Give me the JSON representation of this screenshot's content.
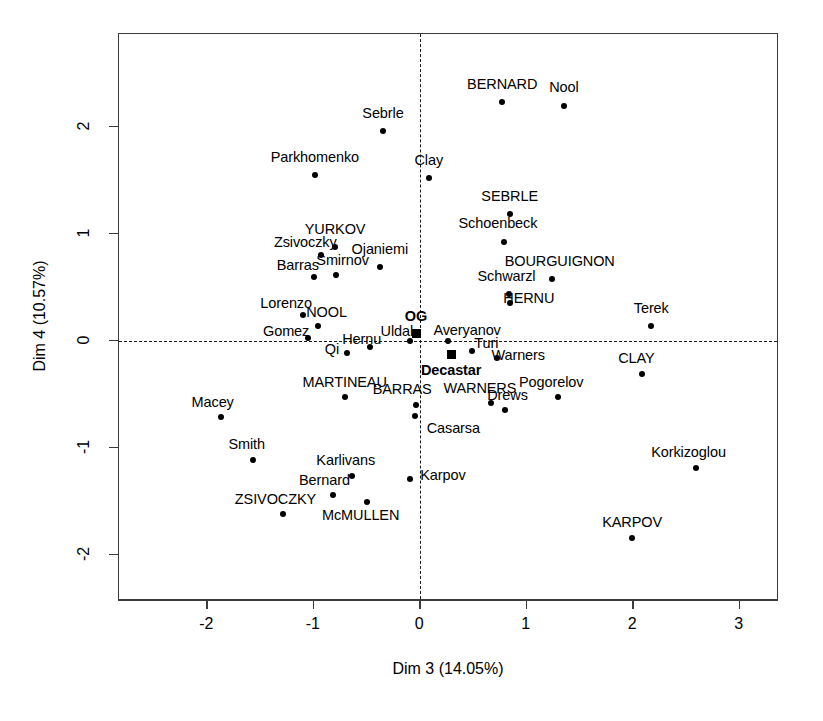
{
  "chart_data": {
    "type": "scatter",
    "title": "",
    "xlabel": "Dim 3 (14.05%)",
    "ylabel": "Dim 4 (10.57%)",
    "xlim": [
      -2.83,
      3.37
    ],
    "ylim": [
      -2.43,
      2.87
    ],
    "xticks": [
      -2,
      -1,
      0,
      1,
      2,
      3
    ],
    "xticklabels": [
      "-2",
      "-1",
      "0",
      "1",
      "2",
      "3"
    ],
    "yticks": [
      -2,
      -1,
      0,
      1,
      2
    ],
    "yticklabels": [
      "-2",
      "-1",
      "0",
      "1",
      "2"
    ],
    "grid": false,
    "legend": false,
    "reference_lines": {
      "vertical_x": 0,
      "horizontal_y": 0,
      "style": "dashed",
      "color": "#1a1a1a"
    },
    "marker_color": "#000000",
    "point_style": {
      "individual": "filled-circle",
      "supplementary": "filled-square"
    },
    "series": [
      {
        "name": "individuals",
        "marker": "circle",
        "points": [
          {
            "label": "Sebrle",
            "x": -0.35,
            "y": 1.96,
            "lx": -0.35,
            "ly": 2.13,
            "anchor": "middle"
          },
          {
            "label": "BERNARD",
            "x": 0.77,
            "y": 2.23,
            "lx": 0.77,
            "ly": 2.4,
            "anchor": "middle"
          },
          {
            "label": "Nool",
            "x": 1.35,
            "y": 2.2,
            "lx": 1.35,
            "ly": 2.37,
            "anchor": "middle"
          },
          {
            "label": "Parkhomenko",
            "x": -0.99,
            "y": 1.55,
            "lx": -0.99,
            "ly": 1.72,
            "anchor": "middle"
          },
          {
            "label": "Clay",
            "x": 0.08,
            "y": 1.52,
            "lx": 0.08,
            "ly": 1.69,
            "anchor": "middle"
          },
          {
            "label": "SEBRLE",
            "x": 0.84,
            "y": 1.19,
            "lx": 0.84,
            "ly": 1.36,
            "anchor": "middle"
          },
          {
            "label": "Schoenbeck",
            "x": 0.79,
            "y": 0.93,
            "lx": 0.73,
            "ly": 1.1,
            "anchor": "middle"
          },
          {
            "label": "YURKOV",
            "x": -0.8,
            "y": 0.88,
            "lx": -0.8,
            "ly": 1.05,
            "anchor": "middle"
          },
          {
            "label": "Zsivoczky",
            "x": -0.93,
            "y": 0.8,
            "lx": -1.08,
            "ly": 0.93,
            "anchor": "middle"
          },
          {
            "label": "Ojaniemi",
            "x": -0.38,
            "y": 0.69,
            "lx": -0.38,
            "ly": 0.86,
            "anchor": "middle"
          },
          {
            "label": "Smirnov",
            "x": -0.79,
            "y": 0.62,
            "lx": -0.73,
            "ly": 0.76,
            "anchor": "middle"
          },
          {
            "label": "Barras",
            "x": -1.0,
            "y": 0.6,
            "lx": -1.15,
            "ly": 0.71,
            "anchor": "middle"
          },
          {
            "label": "Schwarzl",
            "x": 0.83,
            "y": 0.44,
            "lx": 0.81,
            "ly": 0.61,
            "anchor": "middle"
          },
          {
            "label": "BOURGUIGNON",
            "x": 1.24,
            "y": 0.58,
            "lx": 1.31,
            "ly": 0.75,
            "anchor": "middle"
          },
          {
            "label": "HERNU",
            "x": 0.84,
            "y": 0.36,
            "lx": 1.02,
            "ly": 0.4,
            "anchor": "middle"
          },
          {
            "label": "Lorenzo",
            "x": -1.1,
            "y": 0.24,
            "lx": -1.26,
            "ly": 0.36,
            "anchor": "middle"
          },
          {
            "label": "NOOL",
            "x": -0.96,
            "y": 0.14,
            "lx": -0.88,
            "ly": 0.27,
            "anchor": "middle"
          },
          {
            "label": "Terek",
            "x": 2.17,
            "y": 0.14,
            "lx": 2.17,
            "ly": 0.31,
            "anchor": "middle"
          },
          {
            "label": "Gomez",
            "x": -1.05,
            "y": 0.03,
            "lx": -1.26,
            "ly": 0.09,
            "anchor": "middle"
          },
          {
            "label": "Uldal",
            "x": -0.1,
            "y": 0.0,
            "lx": -0.22,
            "ly": 0.09,
            "anchor": "middle"
          },
          {
            "label": "Averyanov",
            "x": 0.26,
            "y": 0.0,
            "lx": 0.44,
            "ly": 0.1,
            "anchor": "middle"
          },
          {
            "label": "Hernu",
            "x": -0.47,
            "y": -0.06,
            "lx": -0.55,
            "ly": 0.02,
            "anchor": "middle"
          },
          {
            "label": "Turi",
            "x": 0.49,
            "y": -0.09,
            "lx": 0.62,
            "ly": -0.02,
            "anchor": "middle"
          },
          {
            "label": "Qi",
            "x": -0.69,
            "y": -0.11,
            "lx": -0.83,
            "ly": -0.07,
            "anchor": "middle"
          },
          {
            "label": "Warners",
            "x": 0.72,
            "y": -0.16,
            "lx": 0.92,
            "ly": -0.13,
            "anchor": "middle"
          },
          {
            "label": "CLAY",
            "x": 2.08,
            "y": -0.31,
            "lx": 2.03,
            "ly": -0.16,
            "anchor": "middle"
          },
          {
            "label": "MARTINEAU",
            "x": -0.71,
            "y": -0.52,
            "lx": -0.71,
            "ly": -0.38,
            "anchor": "middle"
          },
          {
            "label": "BARRAS",
            "x": -0.04,
            "y": -0.6,
            "lx": -0.17,
            "ly": -0.45,
            "anchor": "middle"
          },
          {
            "label": "WARNERS",
            "x": 0.66,
            "y": -0.58,
            "lx": 0.56,
            "ly": -0.44,
            "anchor": "middle"
          },
          {
            "label": "Pogorelov",
            "x": 1.29,
            "y": -0.52,
            "lx": 1.23,
            "ly": -0.38,
            "anchor": "middle"
          },
          {
            "label": "Drews",
            "x": 0.8,
            "y": -0.64,
            "lx": 0.82,
            "ly": -0.5,
            "anchor": "middle"
          },
          {
            "label": "Macey",
            "x": -1.87,
            "y": -0.71,
            "lx": -1.95,
            "ly": -0.57,
            "anchor": "middle"
          },
          {
            "label": "Casarsa",
            "x": -0.05,
            "y": -0.7,
            "lx": 0.06,
            "ly": -0.81,
            "anchor": "start"
          },
          {
            "label": "Smith",
            "x": -1.57,
            "y": -1.11,
            "lx": -1.63,
            "ly": -0.96,
            "anchor": "middle"
          },
          {
            "label": "Korkizoglou",
            "x": 2.59,
            "y": -1.19,
            "lx": 2.52,
            "ly": -1.04,
            "anchor": "middle"
          },
          {
            "label": "Karlivans",
            "x": -0.64,
            "y": -1.26,
            "lx": -0.7,
            "ly": -1.11,
            "anchor": "middle"
          },
          {
            "label": "Karpov",
            "x": -0.1,
            "y": -1.29,
            "lx": 0.0,
            "ly": -1.25,
            "anchor": "start"
          },
          {
            "label": "Bernard",
            "x": -0.82,
            "y": -1.44,
            "lx": -0.9,
            "ly": -1.3,
            "anchor": "middle"
          },
          {
            "label": "McMULLEN",
            "x": -0.5,
            "y": -1.5,
            "lx": -0.56,
            "ly": -1.63,
            "anchor": "middle"
          },
          {
            "label": "ZSIVOCZKY",
            "x": -1.29,
            "y": -1.62,
            "lx": -1.36,
            "ly": -1.48,
            "anchor": "middle"
          },
          {
            "label": "KARPOV",
            "x": 1.99,
            "y": -1.84,
            "lx": 1.99,
            "ly": -1.69,
            "anchor": "middle"
          }
        ]
      },
      {
        "name": "supplementary-groups",
        "marker": "square",
        "bold": true,
        "points": [
          {
            "label": "OG",
            "x": -0.04,
            "y": 0.07,
            "lx": -0.04,
            "ly": 0.23,
            "anchor": "middle"
          },
          {
            "label": "Decastar",
            "x": 0.29,
            "y": -0.13,
            "lx": 0.29,
            "ly": -0.27,
            "anchor": "middle"
          }
        ]
      }
    ]
  }
}
